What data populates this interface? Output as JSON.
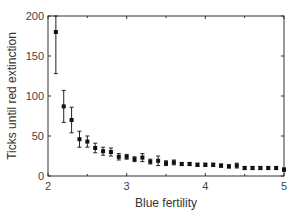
{
  "chart_data": {
    "type": "scatter",
    "title": "",
    "xlabel": "Blue fertility",
    "ylabel": "Ticks until red extinction",
    "xlim": [
      2,
      5
    ],
    "ylim": [
      0,
      200
    ],
    "xticks": [
      2,
      3,
      4,
      5
    ],
    "yticks": [
      0,
      50,
      100,
      150,
      200
    ],
    "grid": false,
    "legend": null,
    "series": [
      {
        "name": "mean with error bars",
        "x": [
          2.1,
          2.2,
          2.3,
          2.4,
          2.5,
          2.6,
          2.7,
          2.8,
          2.9,
          3.0,
          3.1,
          3.2,
          3.3,
          3.4,
          3.5,
          3.6,
          3.7,
          3.8,
          3.9,
          4.0,
          4.1,
          4.2,
          4.3,
          4.4,
          4.5,
          4.6,
          4.7,
          4.8,
          4.9,
          5.0
        ],
        "y": [
          180,
          87,
          70,
          46,
          43,
          35,
          31,
          30,
          24,
          24,
          21,
          23,
          18,
          19,
          16,
          17,
          15,
          15,
          14,
          14,
          14,
          13,
          12,
          13,
          10,
          10,
          10,
          10,
          10,
          8
        ],
        "err": [
          52,
          20,
          16,
          10,
          7,
          6,
          5,
          5,
          4,
          3,
          3,
          5,
          3,
          6,
          3,
          3,
          2,
          2,
          2,
          2,
          2,
          2,
          2,
          3,
          2,
          2,
          2,
          2,
          2,
          2
        ]
      }
    ]
  }
}
